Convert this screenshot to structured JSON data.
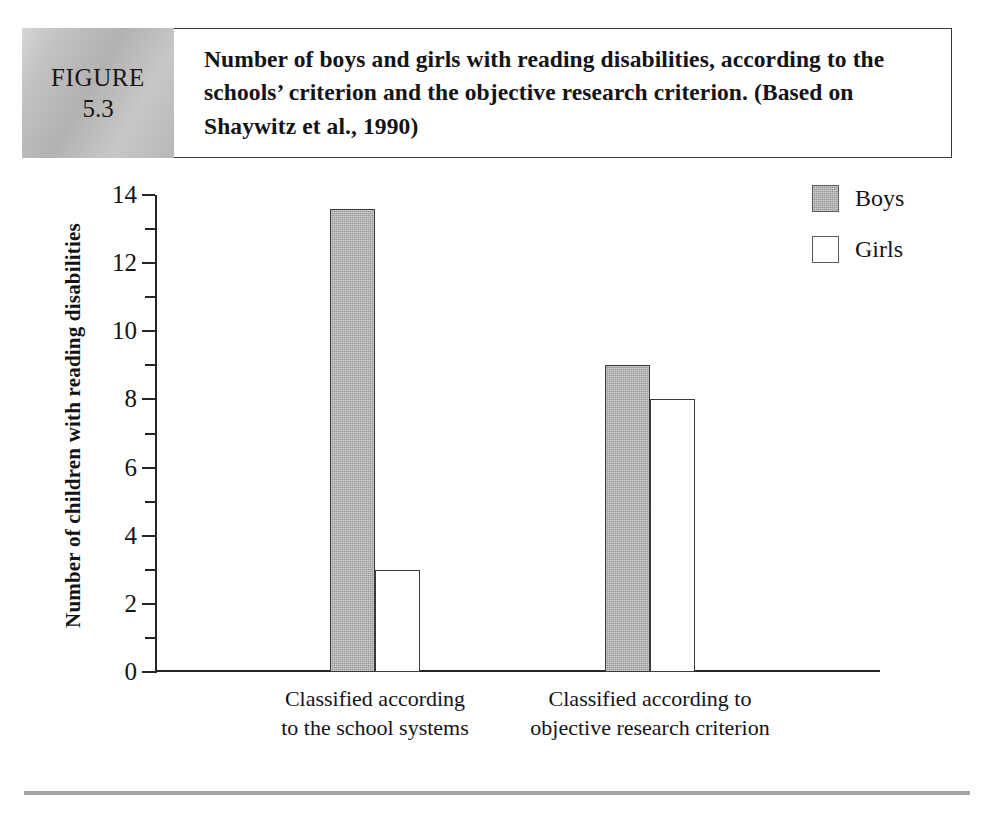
{
  "figure": {
    "badge_word": "FIGURE",
    "badge_number": "5.3",
    "caption": "Number of boys and girls with reading disabilities, according to the schools’ criterion and the objective research criterion. (Based on Shaywitz et al., 1990)"
  },
  "legend": {
    "items": [
      {
        "label": "Boys",
        "swatch": "filled",
        "color": "#a8a8a8"
      },
      {
        "label": "Girls",
        "swatch": "empty",
        "color": "#ffffff"
      }
    ]
  },
  "axis": {
    "y_title": "Number of children with reading disabilities",
    "y_major_ticks": [
      "0",
      "2",
      "4",
      "6",
      "8",
      "10",
      "12",
      "14"
    ],
    "y_minor_ticks": [
      "1",
      "3",
      "5",
      "7",
      "9",
      "11",
      "13"
    ]
  },
  "chart_data": {
    "type": "bar",
    "title": "Number of boys and girls with reading disabilities, according to the schools’ criterion and the objective research criterion. (Based on Shaywitz et al., 1990)",
    "xlabel": "",
    "ylabel": "Number of children with reading disabilities",
    "ylim": [
      0,
      14
    ],
    "ytick_step": 2,
    "minor_tick_step": 1,
    "grid": false,
    "legend_position": "top-right",
    "categories": [
      "Classified according\nto the school systems",
      "Classified according to\nobjective research criterion"
    ],
    "series": [
      {
        "name": "Boys",
        "color": "#a8a8a8",
        "values": [
          13.6,
          9
        ]
      },
      {
        "name": "Girls",
        "color": "#ffffff",
        "values": [
          3,
          8
        ]
      }
    ]
  }
}
